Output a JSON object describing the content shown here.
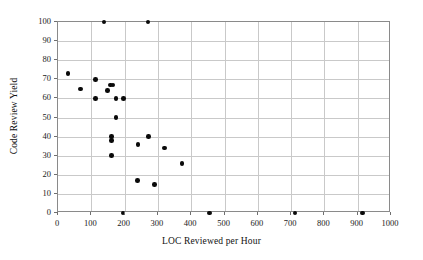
{
  "chart_data": {
    "type": "scatter",
    "title": "",
    "xlabel": "LOC Reviewed per Hour",
    "ylabel": "Code Review Yield",
    "xlim": [
      0,
      1000
    ],
    "ylim": [
      0,
      100
    ],
    "xticks": [
      0,
      100,
      200,
      300,
      400,
      500,
      600,
      700,
      800,
      900,
      1000
    ],
    "yticks": [
      0,
      10,
      20,
      30,
      40,
      50,
      60,
      70,
      80,
      90,
      100
    ],
    "xticklabels": [
      "0",
      "100",
      "200",
      "300",
      "400",
      "500",
      "600",
      "700",
      "800",
      "900",
      "1000"
    ],
    "yticklabels": [
      "0",
      "10",
      "20",
      "30",
      "40",
      "50",
      "60",
      "70",
      "80",
      "90",
      "100"
    ],
    "grid": true,
    "legend": null,
    "marker": "filled-circle",
    "marker_color": "#0a0a0a",
    "points": [
      {
        "x": 30,
        "y": 73
      },
      {
        "x": 68,
        "y": 65
      },
      {
        "x": 112,
        "y": 70
      },
      {
        "x": 113,
        "y": 60
      },
      {
        "x": 138,
        "y": 100
      },
      {
        "x": 148,
        "y": 64
      },
      {
        "x": 158,
        "y": 67
      },
      {
        "x": 165,
        "y": 67
      },
      {
        "x": 160,
        "y": 40
      },
      {
        "x": 160,
        "y": 38
      },
      {
        "x": 160,
        "y": 30
      },
      {
        "x": 174,
        "y": 60
      },
      {
        "x": 174,
        "y": 50
      },
      {
        "x": 196,
        "y": 60
      },
      {
        "x": 195,
        "y": 0
      },
      {
        "x": 238,
        "y": 17
      },
      {
        "x": 240,
        "y": 36
      },
      {
        "x": 270,
        "y": 100
      },
      {
        "x": 271,
        "y": 40
      },
      {
        "x": 290,
        "y": 15
      },
      {
        "x": 320,
        "y": 34
      },
      {
        "x": 372,
        "y": 26
      },
      {
        "x": 455,
        "y": 0
      },
      {
        "x": 712,
        "y": 0
      },
      {
        "x": 915,
        "y": 0
      }
    ]
  },
  "axes": {
    "x_title": "LOC Reviewed per Hour",
    "y_title": "Code Review Yield"
  },
  "colors": {
    "marker": "#0a0a0a",
    "grid": "#c9c9c9",
    "frame": "#8a8a8a",
    "text": "#111111",
    "background": "#ffffff"
  }
}
